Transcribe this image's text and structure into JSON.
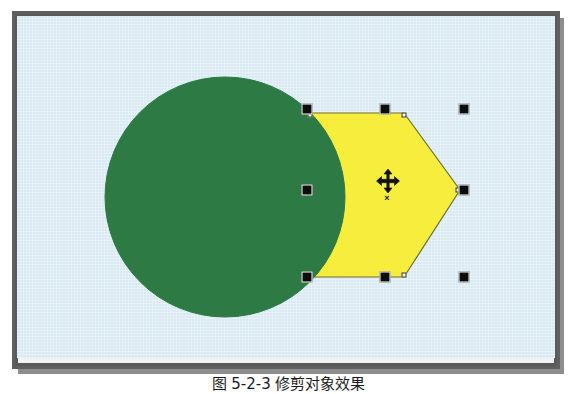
{
  "app": {
    "title": "Vector drawing canvas",
    "document_type": "figure"
  },
  "canvas": {
    "background_color": "#d9eaf3",
    "frame_color": "#5a5a5a",
    "width_px": 538,
    "height_px": 342
  },
  "objects": [
    {
      "name": "green-circle",
      "type": "ellipse",
      "fill_color": "#2d7a45",
      "stroke_color": "#2d7a45",
      "center_x": 225,
      "center_y": 197,
      "radius": 120,
      "selected": false,
      "label": "Circle"
    },
    {
      "name": "yellow-hexagon",
      "type": "polygon",
      "fill_color": "#f6ed3d",
      "stroke_color": "#70702a",
      "sides": 6,
      "selected": true,
      "label": "Hexagon",
      "vertices": [
        {
          "x": 308,
          "y": 113
        },
        {
          "x": 404,
          "y": 113
        },
        {
          "x": 460,
          "y": 190
        },
        {
          "x": 404,
          "y": 277
        },
        {
          "x": 308,
          "y": 277
        },
        {
          "x": 308,
          "y": 190
        }
      ]
    }
  ],
  "selection": {
    "active_object": "yellow-hexagon",
    "handle_color": "#0d0d0d",
    "handle_size_px": 11,
    "bounds": {
      "left": 307,
      "top": 109,
      "right": 464,
      "bottom": 277
    },
    "handles": [
      {
        "name": "handle-top-left",
        "x": 307,
        "y": 109
      },
      {
        "name": "handle-top-center",
        "x": 385,
        "y": 109
      },
      {
        "name": "handle-top-right",
        "x": 464,
        "y": 109
      },
      {
        "name": "handle-middle-left",
        "x": 307,
        "y": 190
      },
      {
        "name": "handle-middle-right",
        "x": 464,
        "y": 190
      },
      {
        "name": "handle-bottom-left",
        "x": 307,
        "y": 277
      },
      {
        "name": "handle-bottom-center",
        "x": 385,
        "y": 277
      },
      {
        "name": "handle-bottom-right",
        "x": 464,
        "y": 277
      }
    ],
    "nodes": [
      {
        "name": "node-top-left",
        "x": 310,
        "y": 115
      },
      {
        "name": "node-top-right",
        "x": 404,
        "y": 115
      },
      {
        "name": "node-right",
        "x": 458,
        "y": 190
      },
      {
        "name": "node-bottom-right",
        "x": 404,
        "y": 275
      },
      {
        "name": "node-bottom-left",
        "x": 310,
        "y": 275
      },
      {
        "name": "node-left",
        "x": 310,
        "y": 190
      }
    ]
  },
  "cursor": {
    "name": "move-cursor",
    "type": "four-way-move",
    "x": 388,
    "y": 181,
    "badge": "×",
    "badge_x": 387,
    "badge_y": 198
  },
  "caption": {
    "text": "图 5-2-3  修剪对象效果"
  }
}
